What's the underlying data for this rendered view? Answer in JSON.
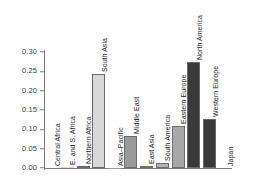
{
  "chart_data": {
    "type": "bar",
    "title": "",
    "subtitle": "",
    "xlabel": "",
    "ylabel": "",
    "ylim": [
      0.0,
      0.3
    ],
    "grid": false,
    "legend": "none",
    "ytick_labels": [
      "0.30",
      "0.25",
      "0.20",
      "0.15",
      "0.10",
      "0.05",
      "0.00"
    ],
    "ytick_values": [
      0.3,
      0.25,
      0.2,
      0.15,
      0.1,
      0.05,
      0.0
    ],
    "categories": [
      "Central Africa",
      "E. and S. Africa",
      "Northern Africa",
      "South Asia",
      "Asia–Pacific",
      "Middle East",
      "East Asia",
      "South America",
      "Eastern Europe",
      "North America",
      "Western Europe",
      "Japan"
    ],
    "values": [
      0.0,
      0.002,
      0.005,
      0.242,
      0.001,
      0.083,
      0.006,
      0.012,
      0.108,
      0.275,
      0.126,
      0.0
    ],
    "bar_colors": [
      "#d8d8d8",
      "#d8d8d8",
      "#d8d8d8",
      "#d8d8d8",
      "#9a9a9a",
      "#9a9a9a",
      "#ededed",
      "#b4b4b4",
      "#a8a8a8",
      "#3a3a3a",
      "#3a3a3a",
      "#3a3a3a"
    ]
  },
  "colors": {
    "axis": "#7c7c7c",
    "text": "#1e1e1e",
    "tick_text": "#3d3d3d",
    "background": "#ffffff",
    "light_gray": "#d8d8d8",
    "mid_gray": "#9a9a9a",
    "dark_gray": "#3a3a3a"
  }
}
